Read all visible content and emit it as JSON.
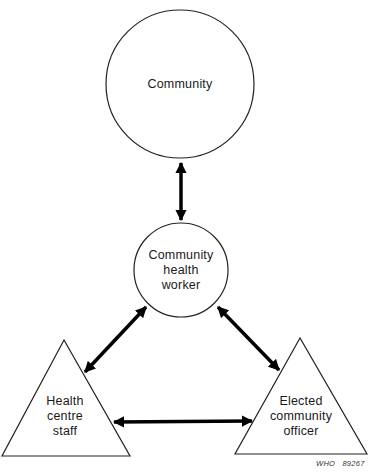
{
  "diagram": {
    "nodes": [
      {
        "id": "community",
        "shape": "circle",
        "label": "Community",
        "lines": [
          "Community"
        ]
      },
      {
        "id": "chw",
        "shape": "circle",
        "label": "Community health worker",
        "lines": [
          "Community",
          "health",
          "worker"
        ]
      },
      {
        "id": "hcs",
        "shape": "triangle",
        "label": "Health centre staff",
        "lines": [
          "Health",
          "centre",
          "staff"
        ]
      },
      {
        "id": "eco",
        "shape": "triangle",
        "label": "Elected community officer",
        "lines": [
          "Elected",
          "community",
          "officer"
        ]
      }
    ],
    "edges": [
      {
        "from": "community",
        "to": "chw",
        "direction": "bidirectional"
      },
      {
        "from": "chw",
        "to": "hcs",
        "direction": "bidirectional"
      },
      {
        "from": "chw",
        "to": "eco",
        "direction": "bidirectional"
      },
      {
        "from": "hcs",
        "to": "eco",
        "direction": "bidirectional"
      }
    ],
    "credit": "WHO   89267",
    "colors": {
      "stroke": "#222222",
      "arrow": "#000000",
      "background": "#ffffff"
    }
  }
}
